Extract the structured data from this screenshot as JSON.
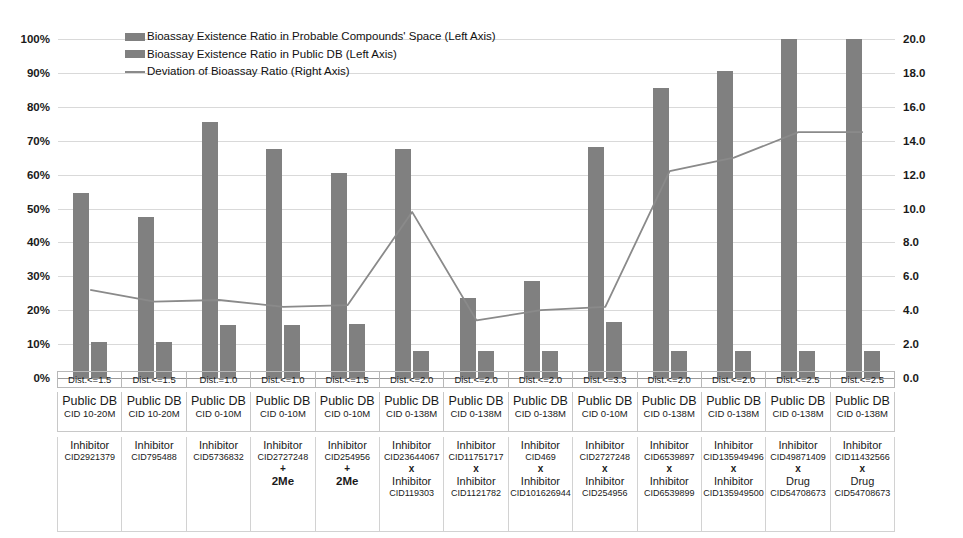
{
  "chart_data": {
    "type": "bar",
    "title": "",
    "xlabel": "",
    "ylabel": "",
    "ylim": [
      0,
      100
    ],
    "y2lim": [
      0,
      20
    ],
    "grid": true,
    "legend_position": "top-left",
    "left_axis_ticks": [
      "0%",
      "10%",
      "20%",
      "30%",
      "40%",
      "50%",
      "60%",
      "70%",
      "80%",
      "90%",
      "100%"
    ],
    "right_axis_ticks": [
      "0.0",
      "2.0",
      "4.0",
      "6.0",
      "8.0",
      "10.0",
      "12.0",
      "14.0",
      "16.0",
      "18.0",
      "20.0"
    ],
    "categories": [
      "Dist.<=1.5 / Public DB CID 10-20M / Inhibitor CID2921379",
      "Dist.<=1.5 / Public DB CID 10-20M / Inhibitor CID795488",
      "Dist.=1.0 / Public DB CID 0-10M / Inhibitor CID5736832",
      "Dist.<=1.0 / Public DB CID 0-10M / Inhibitor CID2727248 + 2Me",
      "Dist.<=1.5 / Public DB CID 0-10M / Inhibitor CID254956 + 2Me",
      "Dist.<=2.0 / Public DB CID 0-138M / Inhibitor CID23644067 x Inhibitor CID119303",
      "Dist.<=2.0 / Public DB CID 0-138M / Inhibitor CID11751717 x Inhibitor CID1121782",
      "Dist.<=2.0 / Public DB CID 0-138M / Inhibitor CID469 x Inhibitor CID101626944",
      "Dist.<=3.3 / Public DB CID 0-10M / Inhibitor CID2727248 x Inhibitor CID254956",
      "Dist.<=2.0 / Public DB CID 0-138M / Inhibitor CID6539897 x Inhibitor CID6539899",
      "Dist.<=2.0 / Public DB CID 0-138M / Inhibitor CID135949496 x Inhibitor CID135949500",
      "Dist.<=2.5 / Public DB CID 0-138M / Inhibitor CID49871409 x Drug CID54708673",
      "Dist.<=2.5 / Public DB CID 0-138M / Inhibitor CID11432566 x Drug CID54708673"
    ],
    "series": [
      {
        "name": "Bioassay Existence Ratio in Probable Compounds' Space (Left Axis)",
        "axis": "left",
        "kind": "bar",
        "color": "#808080",
        "values": [
          54.5,
          47.5,
          75.5,
          67.5,
          60.5,
          67.5,
          23.5,
          28.5,
          68.0,
          85.5,
          90.5,
          100.0,
          100.0
        ]
      },
      {
        "name": "Bioassay Existence Ratio in Public DB (Left Axis)",
        "axis": "left",
        "kind": "bar",
        "color": "#808080",
        "values": [
          10.5,
          10.5,
          15.5,
          15.5,
          16.0,
          8.0,
          8.0,
          8.0,
          16.5,
          8.0,
          8.0,
          8.0,
          8.0
        ]
      },
      {
        "name": "Deviation of Bioassay Ratio (Right Axis)",
        "axis": "right",
        "kind": "line",
        "color": "#8a8a8a",
        "values": [
          5.2,
          4.5,
          4.6,
          4.2,
          4.3,
          9.8,
          3.4,
          4.0,
          4.2,
          12.2,
          13.0,
          14.5,
          14.5
        ]
      }
    ]
  },
  "legend": {
    "items": [
      {
        "label": "Bioassay Existence Ratio in Probable Compounds' Space (Left Axis)",
        "marker": "bar-swatch"
      },
      {
        "label": "Bioassay Existence Ratio in Public DB (Left Axis)",
        "marker": "bar-swatch"
      },
      {
        "label": "Deviation of Bioassay Ratio (Right Axis)",
        "marker": "line-swatch"
      }
    ]
  },
  "xaxis": {
    "dist_row": [
      "Dist.<=1.5",
      "Dist.<=1.5",
      "Dist.=1.0",
      "Dist.<=1.0",
      "Dist.<=1.5",
      "Dist.<=2.0",
      "Dist.<=2.0",
      "Dist.<=2.0",
      "Dist.<=3.3",
      "Dist.<=2.0",
      "Dist.<=2.0",
      "Dist.<=2.5",
      "Dist.<=2.5"
    ],
    "publicdb_row": [
      {
        "title": "Public DB",
        "cid": "CID 10-20M"
      },
      {
        "title": "Public DB",
        "cid": "CID 10-20M"
      },
      {
        "title": "Public DB",
        "cid": "CID 0-10M"
      },
      {
        "title": "Public DB",
        "cid": "CID 0-10M"
      },
      {
        "title": "Public DB",
        "cid": "CID 0-10M"
      },
      {
        "title": "Public DB",
        "cid": "CID 0-138M"
      },
      {
        "title": "Public DB",
        "cid": "CID 0-138M"
      },
      {
        "title": "Public DB",
        "cid": "CID 0-138M"
      },
      {
        "title": "Public DB",
        "cid": "CID 0-10M"
      },
      {
        "title": "Public DB",
        "cid": "CID 0-138M"
      },
      {
        "title": "Public DB",
        "cid": "CID 0-138M"
      },
      {
        "title": "Public DB",
        "cid": "CID 0-138M"
      },
      {
        "title": "Public DB",
        "cid": "CID 0-138M"
      }
    ],
    "inhibitor_row": [
      {
        "kind": "Inhibitor",
        "cid": "CID2921379",
        "op": "",
        "kind2": "",
        "cid2": "",
        "extra": ""
      },
      {
        "kind": "Inhibitor",
        "cid": "CID795488",
        "op": "",
        "kind2": "",
        "cid2": "",
        "extra": ""
      },
      {
        "kind": "Inhibitor",
        "cid": "CID5736832",
        "op": "",
        "kind2": "",
        "cid2": "",
        "extra": ""
      },
      {
        "kind": "Inhibitor",
        "cid": "CID2727248",
        "op": "+",
        "kind2": "",
        "cid2": "",
        "extra": "2Me"
      },
      {
        "kind": "Inhibitor",
        "cid": "CID254956",
        "op": "+",
        "kind2": "",
        "cid2": "",
        "extra": "2Me"
      },
      {
        "kind": "Inhibitor",
        "cid": "CID23644067",
        "op": "x",
        "kind2": "Inhibitor",
        "cid2": "CID119303",
        "extra": ""
      },
      {
        "kind": "Inhibitor",
        "cid": "CID11751717",
        "op": "x",
        "kind2": "Inhibitor",
        "cid2": "CID1121782",
        "extra": ""
      },
      {
        "kind": "Inhibitor",
        "cid": "CID469",
        "op": "x",
        "kind2": "Inhibitor",
        "cid2": "CID101626944",
        "extra": ""
      },
      {
        "kind": "Inhibitor",
        "cid": "CID2727248",
        "op": "x",
        "kind2": "Inhibitor",
        "cid2": "CID254956",
        "extra": ""
      },
      {
        "kind": "Inhibitor",
        "cid": "CID6539897",
        "op": "x",
        "kind2": "Inhibitor",
        "cid2": "CID6539899",
        "extra": ""
      },
      {
        "kind": "Inhibitor",
        "cid": "CID135949496",
        "op": "x",
        "kind2": "Inhibitor",
        "cid2": "CID135949500",
        "extra": ""
      },
      {
        "kind": "Inhibitor",
        "cid": "CID49871409",
        "op": "x",
        "kind2": "Drug",
        "cid2": "CID54708673",
        "extra": ""
      },
      {
        "kind": "Inhibitor",
        "cid": "CID11432566",
        "op": "x",
        "kind2": "Drug",
        "cid2": "CID54708673",
        "extra": ""
      }
    ]
  },
  "colors": {
    "bar": "#808080",
    "line": "#8a8a8a",
    "grid": "#d9d9d9",
    "text": "#1a1a1a"
  }
}
